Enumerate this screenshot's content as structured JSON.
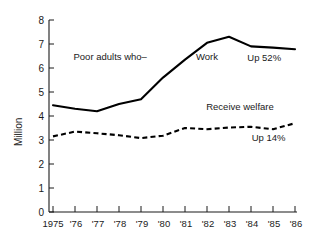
{
  "chart_data": {
    "type": "line",
    "title": "",
    "xlabel": "",
    "ylabel": "Million",
    "ylim": [
      0,
      8
    ],
    "yticks": [
      0,
      1,
      2,
      3,
      4,
      5,
      6,
      7,
      8
    ],
    "grid": false,
    "legend_position": "inline-annotations",
    "categories": [
      "1975",
      "'76",
      "'77",
      "'78",
      "'79",
      "'80",
      "'81",
      "'82",
      "'83",
      "'84",
      "'85",
      "'86"
    ],
    "x": [
      1975,
      1976,
      1977,
      1978,
      1979,
      1980,
      1981,
      1982,
      1983,
      1984,
      1985,
      1986
    ],
    "series": [
      {
        "name": "Work",
        "style": "solid",
        "values": [
          4.45,
          4.3,
          4.2,
          4.5,
          4.7,
          5.6,
          6.35,
          7.05,
          7.3,
          6.9,
          6.85,
          6.78
        ]
      },
      {
        "name": "Receive welfare",
        "style": "dashed",
        "values": [
          3.15,
          3.35,
          3.28,
          3.2,
          3.08,
          3.18,
          3.5,
          3.45,
          3.52,
          3.55,
          3.45,
          3.7
        ]
      }
    ],
    "annotations": [
      {
        "text": "Poor adults who–",
        "x": 1977.6,
        "y": 6.35
      },
      {
        "text": "Work",
        "x": 1982.0,
        "y": 6.33
      },
      {
        "text": "Up 52%",
        "x": 1984.6,
        "y": 6.28
      },
      {
        "text": "Receive welfare",
        "x": 1983.5,
        "y": 4.25
      },
      {
        "text": "Up 14%",
        "x": 1984.8,
        "y": 2.95
      }
    ]
  },
  "axis": {
    "y_label": "Million",
    "y_tick_0": "0",
    "y_tick_1": "1",
    "y_tick_2": "2",
    "y_tick_3": "3",
    "y_tick_4": "4",
    "y_tick_5": "5",
    "y_tick_6": "6",
    "y_tick_7": "7",
    "y_tick_8": "8",
    "x_tick_0": "1975",
    "x_tick_1": "'76",
    "x_tick_2": "'77",
    "x_tick_3": "'78",
    "x_tick_4": "'79",
    "x_tick_5": "'80",
    "x_tick_6": "'81",
    "x_tick_7": "'82",
    "x_tick_8": "'83",
    "x_tick_9": "'84",
    "x_tick_10": "'85",
    "x_tick_11": "'86"
  },
  "annotations": {
    "poor_adults": "Poor adults who–",
    "work": "Work",
    "up_52": "Up 52%",
    "receive_welfare": "Receive welfare",
    "up_14": "Up 14%"
  },
  "colors": {
    "background": "#ffffff",
    "ink": "#1a1a1a",
    "series": "#000000"
  }
}
